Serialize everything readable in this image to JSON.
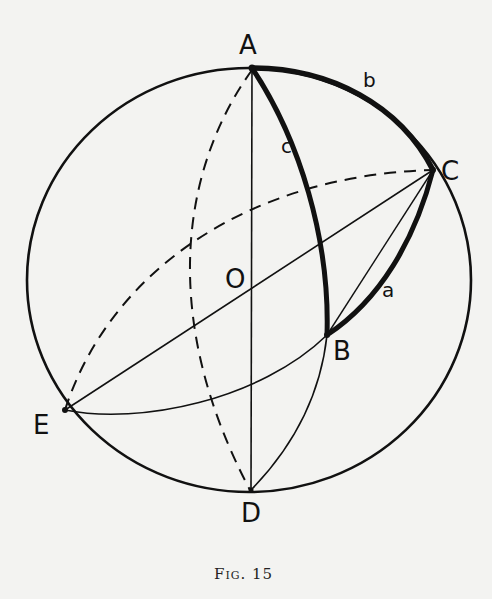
{
  "figure": {
    "caption": "Fig. 15",
    "points": {
      "A": "A",
      "B": "B",
      "C": "C",
      "D": "D",
      "E": "E",
      "O": "O"
    },
    "arc_labels": {
      "a": "a",
      "b": "b",
      "c": "c"
    },
    "colors": {
      "background": "#f3f3f1",
      "ink": "#111111"
    }
  }
}
